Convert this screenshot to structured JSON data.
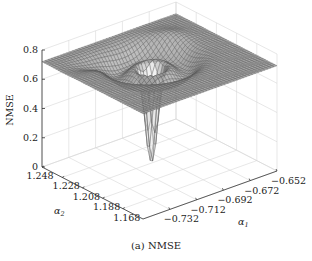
{
  "caption": "(a)  NMSE",
  "chart_data": {
    "type": "surface3d",
    "title": "",
    "caption": "(a) NMSE",
    "xlabel": "α1",
    "ylabel": "α2",
    "zlabel": "NMSE",
    "x_ticks": [
      "-0.732",
      "-0.712",
      "-0.692",
      "-0.672",
      "-0.652"
    ],
    "y_ticks": [
      "1.248",
      "1.228",
      "1.208",
      "1.188",
      "1.168"
    ],
    "z_ticks": [
      "0",
      "0.2",
      "0.4",
      "0.6",
      "0.8"
    ],
    "xlim": [
      -0.742,
      -0.652
    ],
    "ylim": [
      1.168,
      1.258
    ],
    "zlim": [
      0,
      0.8
    ],
    "grid": true,
    "surface": {
      "plateau_value": 0.72,
      "minimum": {
        "alpha1": -0.697,
        "alpha2": 1.208,
        "nmse": 0.0
      },
      "description": "Flat plateau near 0.72 with a sharp funnel-shaped dip to ~0 at the centre, surrounded by a shallow ring-shaped depression (~0.55-0.65)"
    },
    "colormap": "gray mesh"
  }
}
